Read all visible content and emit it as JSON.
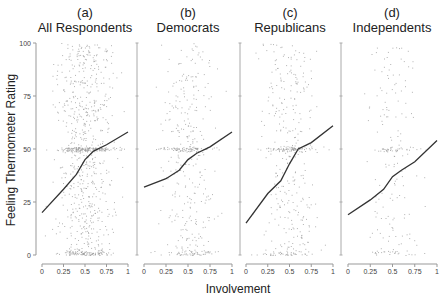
{
  "figure": {
    "ylabel": "Feeling Thermometer Rating",
    "xlabel": "Involvement",
    "yticks": [
      "0",
      "25",
      "50",
      "75",
      "100"
    ],
    "xticks": [
      "0",
      "0.25",
      "0.5",
      "0.75",
      "1"
    ],
    "panels": [
      {
        "letter": "(a)",
        "title": "All Respondents"
      },
      {
        "letter": "(b)",
        "title": "Democrats"
      },
      {
        "letter": "(c)",
        "title": "Republicans"
      },
      {
        "letter": "(d)",
        "title": "Independents"
      }
    ],
    "colors": {
      "line": "#333333",
      "points": "#9a9a9a",
      "axis": "#999999",
      "text": "#222222"
    }
  },
  "chart_data": [
    {
      "type": "scatter",
      "title": "(a) All Respondents",
      "xlabel": "Involvement",
      "ylabel": "Feeling Thermometer Rating",
      "xlim": [
        0,
        1
      ],
      "ylim": [
        0,
        100
      ],
      "grid": false,
      "series": [
        {
          "name": "respondents (jittered)",
          "kind": "scatter",
          "density": "dense",
          "cluster_y": [
            0,
            50
          ]
        },
        {
          "name": "smoothed fit",
          "kind": "line",
          "x": [
            0,
            0.25,
            0.4,
            0.5,
            0.6,
            0.75,
            1
          ],
          "y": [
            20,
            31,
            38,
            45,
            49,
            52,
            58
          ]
        }
      ]
    },
    {
      "type": "scatter",
      "title": "(b) Democrats",
      "xlabel": "Involvement",
      "ylabel": "Feeling Thermometer Rating",
      "xlim": [
        0,
        1
      ],
      "ylim": [
        0,
        100
      ],
      "grid": false,
      "series": [
        {
          "name": "respondents (jittered)",
          "kind": "scatter",
          "density": "medium",
          "cluster_y": [
            0,
            50
          ]
        },
        {
          "name": "smoothed fit",
          "kind": "line",
          "x": [
            0,
            0.25,
            0.4,
            0.5,
            0.6,
            0.75,
            1
          ],
          "y": [
            32,
            36,
            40,
            45,
            48,
            51,
            58
          ]
        }
      ]
    },
    {
      "type": "scatter",
      "title": "(c) Republicans",
      "xlabel": "Involvement",
      "ylabel": "Feeling Thermometer Rating",
      "xlim": [
        0,
        1
      ],
      "ylim": [
        0,
        100
      ],
      "grid": false,
      "series": [
        {
          "name": "respondents (jittered)",
          "kind": "scatter",
          "density": "medium",
          "cluster_y": [
            0,
            50
          ]
        },
        {
          "name": "smoothed fit",
          "kind": "line",
          "x": [
            0,
            0.25,
            0.4,
            0.5,
            0.6,
            0.75,
            1
          ],
          "y": [
            15,
            29,
            35,
            43,
            50,
            53,
            61
          ]
        }
      ]
    },
    {
      "type": "scatter",
      "title": "(d) Independents",
      "xlabel": "Involvement",
      "ylabel": "Feeling Thermometer Rating",
      "xlim": [
        0,
        1
      ],
      "ylim": [
        0,
        100
      ],
      "grid": false,
      "series": [
        {
          "name": "respondents (jittered)",
          "kind": "scatter",
          "density": "sparse",
          "cluster_y": [
            0,
            50
          ]
        },
        {
          "name": "smoothed fit",
          "kind": "line",
          "x": [
            0,
            0.25,
            0.4,
            0.5,
            0.6,
            0.75,
            1
          ],
          "y": [
            19,
            26,
            31,
            37,
            40,
            44,
            54
          ]
        }
      ]
    }
  ]
}
